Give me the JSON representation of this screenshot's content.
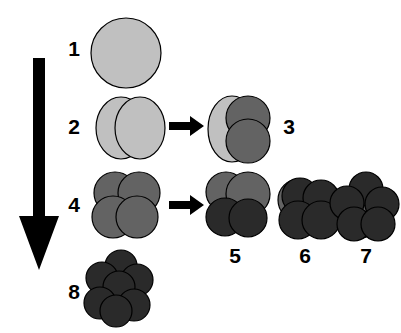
{
  "figure": {
    "background_color": "#ffffff",
    "width": 401,
    "height": 333
  },
  "palette": {
    "light_gray": "#c0c0c0",
    "medium_gray": "#636363",
    "dark_gray": "#2a2a2a",
    "outline": "#000000",
    "arrow_black": "#000000"
  },
  "progression_arrow": {
    "name": "downward-progression-arrow",
    "direction": "down",
    "color": "#000000",
    "x": 38,
    "y_start": 60,
    "y_end": 268
  },
  "transition_arrows": [
    {
      "label": "arrow-2-to-3",
      "direction": "right",
      "color": "#000000",
      "x": 170,
      "y": 124
    },
    {
      "label": "arrow-4-to-5",
      "direction": "right",
      "color": "#000000",
      "x": 170,
      "y": 203
    }
  ],
  "stages": [
    {
      "id": 1,
      "label": "1",
      "label_x": 63,
      "label_y": 38,
      "description": "single large light gray sphere",
      "particle_count": 1,
      "shades": [
        "light_gray"
      ],
      "cluster_x": 88,
      "cluster_y": 14,
      "cluster_w": 76,
      "cluster_h": 78,
      "shapes": [
        {
          "type": "ellipse",
          "cx": 38,
          "cy": 39,
          "rx": 35,
          "ry": 35,
          "fill": "#c0c0c0"
        }
      ]
    },
    {
      "id": 2,
      "label": "2",
      "label_x": 63,
      "label_y": 116,
      "description": "two light gray ellipsoids side by side",
      "particle_count": 2,
      "shades": [
        "light_gray",
        "light_gray"
      ],
      "cluster_x": 94,
      "cluster_y": 95,
      "cluster_w": 72,
      "cluster_h": 66,
      "shapes": [
        {
          "type": "ellipse",
          "cx": 27,
          "cy": 33,
          "rx": 25,
          "ry": 31,
          "fill": "#c0c0c0"
        },
        {
          "type": "ellipse",
          "cx": 46,
          "cy": 33,
          "rx": 25,
          "ry": 31,
          "fill": "#c0c0c0"
        }
      ]
    },
    {
      "id": 3,
      "label": "3",
      "label_x": 278,
      "label_y": 116,
      "description": "light gray ellipsoid behind two medium gray spheres",
      "particle_count": 3,
      "shades": [
        "light_gray",
        "medium_gray",
        "medium_gray"
      ],
      "cluster_x": 206,
      "cluster_y": 95,
      "cluster_w": 68,
      "cluster_h": 70,
      "shapes": [
        {
          "type": "ellipse",
          "cx": 26,
          "cy": 34,
          "rx": 24,
          "ry": 33,
          "fill": "#c0c0c0"
        },
        {
          "type": "ellipse",
          "cx": 42,
          "cy": 23,
          "rx": 22,
          "ry": 22,
          "fill": "#636363"
        },
        {
          "type": "ellipse",
          "cx": 42,
          "cy": 46,
          "rx": 22,
          "ry": 22,
          "fill": "#636363"
        }
      ]
    },
    {
      "id": 4,
      "label": "4",
      "label_x": 63,
      "label_y": 194,
      "description": "four medium gray spheres in a square cluster",
      "particle_count": 4,
      "shades": [
        "medium_gray",
        "medium_gray",
        "medium_gray",
        "medium_gray"
      ],
      "cluster_x": 92,
      "cluster_y": 172,
      "cluster_w": 72,
      "cluster_h": 70,
      "shapes": [
        {
          "type": "ellipse",
          "cx": 23,
          "cy": 21,
          "rx": 21,
          "ry": 21,
          "fill": "#636363"
        },
        {
          "type": "ellipse",
          "cx": 47,
          "cy": 21,
          "rx": 21,
          "ry": 21,
          "fill": "#636363"
        },
        {
          "type": "ellipse",
          "cx": 21,
          "cy": 45,
          "rx": 21,
          "ry": 21,
          "fill": "#636363"
        },
        {
          "type": "ellipse",
          "cx": 45,
          "cy": 45,
          "rx": 21,
          "ry": 21,
          "fill": "#636363"
        }
      ]
    },
    {
      "id": 5,
      "label": "5",
      "label_x": 224,
      "label_y": 245,
      "description": "two medium gray spheres above two dark spheres",
      "particle_count": 4,
      "shades": [
        "medium_gray",
        "medium_gray",
        "dark_gray",
        "dark_gray"
      ],
      "cluster_x": 204,
      "cluster_y": 172,
      "cluster_w": 70,
      "cluster_h": 70,
      "shapes": [
        {
          "type": "ellipse",
          "cx": 22,
          "cy": 20,
          "rx": 20,
          "ry": 20,
          "fill": "#636363"
        },
        {
          "type": "ellipse",
          "cx": 44,
          "cy": 22,
          "rx": 22,
          "ry": 22,
          "fill": "#636363"
        },
        {
          "type": "ellipse",
          "cx": 21,
          "cy": 45,
          "rx": 19,
          "ry": 19,
          "fill": "#2a2a2a"
        },
        {
          "type": "ellipse",
          "cx": 44,
          "cy": 46,
          "rx": 19,
          "ry": 19,
          "fill": "#2a2a2a"
        }
      ]
    },
    {
      "id": 6,
      "label": "6",
      "label_x": 294,
      "label_y": 245,
      "description": "mostly dark spheres with medium gray spheres behind",
      "particle_count": 5,
      "shades": [
        "medium_gray",
        "dark_gray",
        "dark_gray",
        "dark_gray",
        "dark_gray"
      ],
      "cluster_x": 276,
      "cluster_y": 176,
      "cluster_w": 66,
      "cluster_h": 66,
      "shapes": [
        {
          "type": "ellipse",
          "cx": 23,
          "cy": 24,
          "rx": 21,
          "ry": 21,
          "fill": "#636363"
        },
        {
          "type": "ellipse",
          "cx": 24,
          "cy": 20,
          "rx": 18,
          "ry": 18,
          "fill": "#2a2a2a"
        },
        {
          "type": "ellipse",
          "cx": 45,
          "cy": 22,
          "rx": 18,
          "ry": 18,
          "fill": "#2a2a2a"
        },
        {
          "type": "ellipse",
          "cx": 22,
          "cy": 44,
          "rx": 19,
          "ry": 19,
          "fill": "#2a2a2a"
        },
        {
          "type": "ellipse",
          "cx": 45,
          "cy": 44,
          "rx": 19,
          "ry": 19,
          "fill": "#2a2a2a"
        }
      ]
    },
    {
      "id": 7,
      "label": "7",
      "label_x": 355,
      "label_y": 245,
      "description": "dense dark sphere cluster with medium gray sphere peeking behind",
      "particle_count": 6,
      "shades": [
        "medium_gray",
        "dark_gray",
        "dark_gray",
        "dark_gray",
        "dark_gray",
        "dark_gray"
      ],
      "cluster_x": 330,
      "cluster_y": 172,
      "cluster_w": 68,
      "cluster_h": 70,
      "shapes": [
        {
          "type": "ellipse",
          "cx": 30,
          "cy": 45,
          "rx": 21,
          "ry": 21,
          "fill": "#636363"
        },
        {
          "type": "ellipse",
          "cx": 36,
          "cy": 17,
          "rx": 17,
          "ry": 17,
          "fill": "#2a2a2a"
        },
        {
          "type": "ellipse",
          "cx": 17,
          "cy": 31,
          "rx": 17,
          "ry": 17,
          "fill": "#2a2a2a"
        },
        {
          "type": "ellipse",
          "cx": 52,
          "cy": 32,
          "rx": 17,
          "ry": 17,
          "fill": "#2a2a2a"
        },
        {
          "type": "ellipse",
          "cx": 24,
          "cy": 52,
          "rx": 17,
          "ry": 17,
          "fill": "#2a2a2a"
        },
        {
          "type": "ellipse",
          "cx": 48,
          "cy": 52,
          "rx": 17,
          "ry": 17,
          "fill": "#2a2a2a"
        }
      ]
    },
    {
      "id": 8,
      "label": "8",
      "label_x": 63,
      "label_y": 281,
      "description": "fully dark compact sphere cluster",
      "particle_count": 7,
      "shades": [
        "dark_gray",
        "dark_gray",
        "dark_gray",
        "dark_gray",
        "dark_gray",
        "dark_gray",
        "dark_gray"
      ],
      "cluster_x": 84,
      "cluster_y": 253,
      "cluster_w": 70,
      "cluster_h": 76,
      "shapes": [
        {
          "type": "ellipse",
          "cx": 37,
          "cy": 13,
          "rx": 16,
          "ry": 16,
          "fill": "#2a2a2a"
        },
        {
          "type": "ellipse",
          "cx": 18,
          "cy": 25,
          "rx": 16,
          "ry": 16,
          "fill": "#2a2a2a"
        },
        {
          "type": "ellipse",
          "cx": 53,
          "cy": 27,
          "rx": 16,
          "ry": 16,
          "fill": "#2a2a2a"
        },
        {
          "type": "ellipse",
          "cx": 35,
          "cy": 34,
          "rx": 16,
          "ry": 16,
          "fill": "#2a2a2a"
        },
        {
          "type": "ellipse",
          "cx": 16,
          "cy": 50,
          "rx": 16,
          "ry": 16,
          "fill": "#2a2a2a"
        },
        {
          "type": "ellipse",
          "cx": 50,
          "cy": 52,
          "rx": 16,
          "ry": 16,
          "fill": "#2a2a2a"
        },
        {
          "type": "ellipse",
          "cx": 32,
          "cy": 58,
          "rx": 16,
          "ry": 16,
          "fill": "#2a2a2a"
        }
      ]
    }
  ]
}
